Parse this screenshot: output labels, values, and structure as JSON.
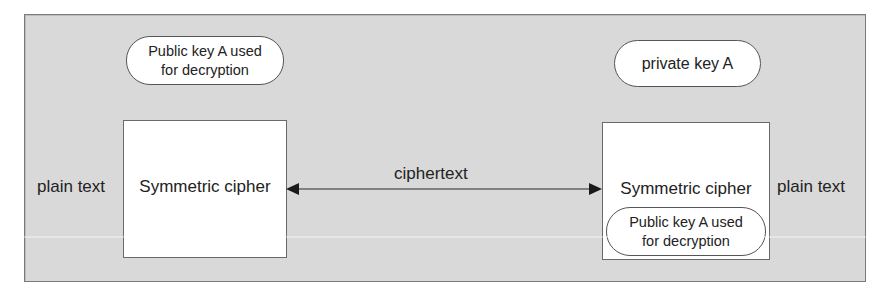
{
  "diagram": {
    "colors": {
      "frame_background": "#d9d9d9",
      "frame_border": "#7a7a7a",
      "box_fill": "#ffffff",
      "stroke": "#222222"
    },
    "left": {
      "key_pill": {
        "line1": "Public key A used",
        "line2": "for decryption"
      },
      "box_label": "Symmetric cipher",
      "side_label": "plain text"
    },
    "right": {
      "key_pill": {
        "text": "private key A"
      },
      "box_label": "Symmetric cipher",
      "inner_pill": {
        "line1": "Public key A used",
        "line2": "for decryption"
      },
      "side_label": "plain text"
    },
    "connector": {
      "label": "ciphertext",
      "type": "double-headed-arrow"
    }
  }
}
